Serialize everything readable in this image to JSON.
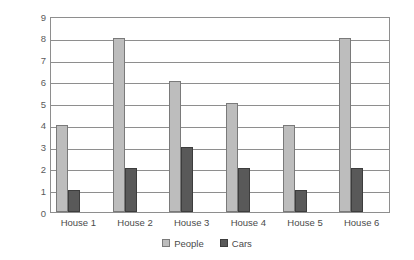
{
  "chart_data": {
    "type": "bar",
    "title": "",
    "subtitle": "",
    "xlabel": "",
    "ylabel": "Number of people/cars",
    "categories": [
      "House 1",
      "House 2",
      "House 3",
      "House 4",
      "House 5",
      "House 6"
    ],
    "series": [
      {
        "name": "People",
        "values": [
          4,
          8,
          6,
          5,
          4,
          8
        ],
        "color": "#bdbdbd"
      },
      {
        "name": "Cars",
        "values": [
          1,
          2,
          3,
          2,
          1,
          2
        ],
        "color": "#595959"
      }
    ],
    "ylim": [
      0,
      9
    ],
    "ytick_labels": [
      "0",
      "1",
      "2",
      "3",
      "4",
      "5",
      "6",
      "7",
      "8",
      "9"
    ],
    "ytick_values": [
      0,
      1,
      2,
      3,
      4,
      5,
      6,
      7,
      8,
      9
    ],
    "grid": true,
    "grid_axis": "y",
    "legend_position": "bottom-center",
    "legend_entries": [
      "People",
      "Cars"
    ],
    "annotations": [],
    "axis_color": "#8e8e8e",
    "text_color": "#4a4a4a",
    "background": "#ffffff"
  }
}
